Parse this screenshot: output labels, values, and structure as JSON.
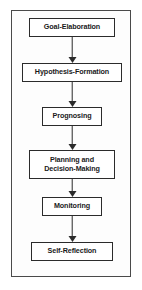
{
  "diagram": {
    "orientation": "vertical-top-to-bottom",
    "frame_color": "#4a4a4a",
    "node_border_color": "#2b2b2b",
    "node_fill_color": "#ffffff",
    "arrow_color": "#2b2b2b",
    "background_color": "#ffffff",
    "nodes": [
      {
        "id": "goal-elaboration",
        "label": "Goal-Elaboration",
        "x": 29,
        "y": 18,
        "width": 86,
        "height": 19
      },
      {
        "id": "hypothesis-formation",
        "label": "Hypothesis-Formation",
        "x": 22,
        "y": 63,
        "width": 100,
        "height": 19
      },
      {
        "id": "prognosing",
        "label": "Prognosing",
        "x": 42,
        "y": 107,
        "width": 60,
        "height": 19
      },
      {
        "id": "planning-and-decision-making",
        "label": "Planning and\nDecision-Making",
        "x": 29,
        "y": 150,
        "width": 86,
        "height": 29
      },
      {
        "id": "monitoring",
        "label": "Monitoring",
        "x": 42,
        "y": 197,
        "width": 60,
        "height": 19
      },
      {
        "id": "self-reflection",
        "label": "Self-Reflection",
        "x": 31,
        "y": 242,
        "width": 82,
        "height": 19
      }
    ],
    "arrows": [
      {
        "id": "arrow-goal-to-hypothesis",
        "from": "goal-elaboration",
        "to": "hypothesis-formation",
        "x": 72,
        "y": 37,
        "length": 26
      },
      {
        "id": "arrow-hypothesis-to-prognosing",
        "from": "hypothesis-formation",
        "to": "prognosing",
        "x": 72,
        "y": 82,
        "length": 25
      },
      {
        "id": "arrow-prognosing-to-planning",
        "from": "prognosing",
        "to": "planning-and-decision-making",
        "x": 72,
        "y": 126,
        "length": 24
      },
      {
        "id": "arrow-planning-to-monitoring",
        "from": "planning-and-decision-making",
        "to": "monitoring",
        "x": 72,
        "y": 179,
        "length": 18
      },
      {
        "id": "arrow-monitoring-to-self-reflection",
        "from": "monitoring",
        "to": "self-reflection",
        "x": 72,
        "y": 216,
        "length": 26
      }
    ]
  }
}
